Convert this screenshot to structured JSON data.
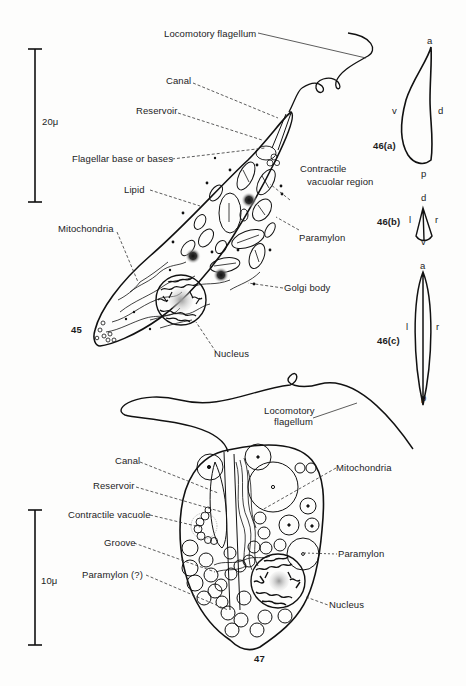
{
  "figure_45": {
    "number": "45",
    "scale_bar": "20μ",
    "labels": {
      "locomotory_flagellum": "Locomotory flagellum",
      "canal": "Canal",
      "reservoir": "Reservoir",
      "flagellar_base": "Flagellar base or bases",
      "contractile_vacuolar_region_1": "Contractile",
      "contractile_vacuolar_region_2": "vacuolar region",
      "lipid": "Lipid",
      "paramylon": "Paramylon",
      "mitochondria": "Mitochondria",
      "golgi_body": "Golgi body",
      "nucleus": "Nucleus"
    }
  },
  "figure_46a": {
    "number": "46(a)",
    "axes": {
      "anterior": "a",
      "posterior": "p",
      "ventral": "v",
      "dorsal": "d"
    }
  },
  "figure_46b": {
    "number": "46(b)",
    "axes": {
      "dorsal": "d",
      "ventral": "v",
      "left": "l",
      "right": "r"
    }
  },
  "figure_46c": {
    "number": "46(c)",
    "axes": {
      "anterior": "a",
      "posterior": "p",
      "left": "l",
      "right": "r"
    }
  },
  "figure_47": {
    "number": "47",
    "scale_bar": "10μ",
    "labels": {
      "locomotory_flagellum_1": "Locomotory",
      "locomotory_flagellum_2": "flagellum",
      "canal": "Canal",
      "reservoir": "Reservoir",
      "contractile_vacuole": "Contractile vacuole",
      "groove": "Groove",
      "paramylon_q": "Paramylon (?)",
      "mitochondria": "Mitochondria",
      "paramylon": "Paramylon",
      "nucleus": "Nucleus"
    }
  }
}
